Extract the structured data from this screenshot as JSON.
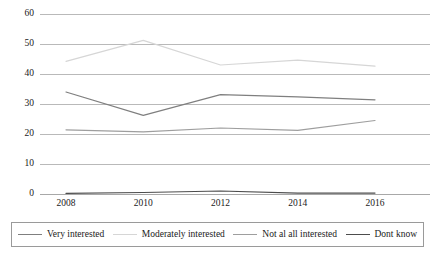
{
  "chart_data": {
    "type": "line",
    "title": "",
    "subtitle": "",
    "xlabel": "",
    "ylabel": "",
    "x": [
      2008,
      2010,
      2012,
      2014,
      2016
    ],
    "categories": [
      "2008",
      "2010",
      "2012",
      "2014",
      "2016"
    ],
    "xtick_labels": [
      "2008",
      "2010",
      "2012",
      "2014",
      "2016"
    ],
    "ytick_labels": [
      "0",
      "10",
      "20",
      "30",
      "40",
      "50",
      "60"
    ],
    "ytick_values": [
      0,
      10,
      20,
      30,
      40,
      50,
      60
    ],
    "ylim": [
      0,
      60
    ],
    "xlim": [
      2007,
      2017
    ],
    "grid": true,
    "grid_axis": "y",
    "legend_position": "bottom",
    "series": [
      {
        "name": "Very interested",
        "color": "#7f7f7f",
        "values": [
          34.0,
          26.2,
          33.1,
          32.4,
          31.4
        ]
      },
      {
        "name": "Moderately interested",
        "color": "#d6d6d6",
        "values": [
          44.2,
          51.2,
          43.0,
          44.6,
          42.6
        ]
      },
      {
        "name": "Not al all interested",
        "color": "#9e9e9e",
        "values": [
          21.4,
          20.7,
          22.0,
          21.2,
          24.5
        ]
      },
      {
        "name": "Dont know",
        "color": "#4d4d4d",
        "values": [
          0.2,
          0.5,
          1.0,
          0.3,
          0.3
        ]
      }
    ]
  },
  "legend": {
    "items": [
      {
        "label": "Very interested",
        "color": "#7f7f7f"
      },
      {
        "label": "Moderately interested",
        "color": "#d6d6d6"
      },
      {
        "label": "Not al all interested",
        "color": "#9e9e9e"
      },
      {
        "label": "Dont know",
        "color": "#4d4d4d"
      }
    ]
  },
  "style": {
    "background": "#ffffff",
    "gridline_color": "#b9b9b9",
    "axis_text_color": "#1a1a1a",
    "legend_border_color": "#9a9a9a"
  }
}
